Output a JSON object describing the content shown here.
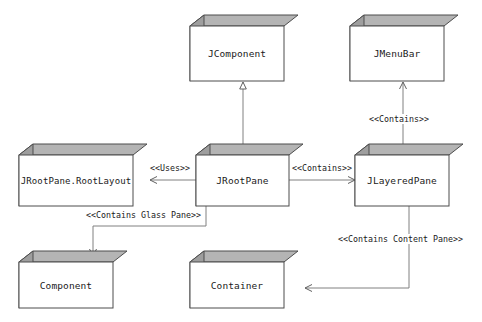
{
  "diagram": {
    "type": "uml-class-diagram",
    "background_color": "#ffffff",
    "box_face_color": "#ffffff",
    "box_shade_color": "#a0a0a0",
    "box_top_color": "#b4b4b4",
    "stroke_color": "#4d4d4d",
    "nodes": [
      {
        "id": "jcomponent",
        "label": "JComponent"
      },
      {
        "id": "jmenubar",
        "label": "JMenuBar"
      },
      {
        "id": "jrootpane_rootlayout",
        "label": "JRootPane.RootLayout"
      },
      {
        "id": "jrootpane",
        "label": "JRootPane"
      },
      {
        "id": "jlayeredpane",
        "label": "JLayeredPane"
      },
      {
        "id": "component",
        "label": "Component"
      },
      {
        "id": "container",
        "label": "Container"
      }
    ],
    "edges": [
      {
        "id": "e-inherit",
        "from": "jrootpane",
        "to": "jcomponent",
        "label": "",
        "arrow": "hollow-triangle"
      },
      {
        "id": "e-uses",
        "from": "jrootpane",
        "to": "jrootpane_rootlayout",
        "label": "<<Uses>>",
        "arrow": "open"
      },
      {
        "id": "e-contains-lp",
        "from": "jrootpane",
        "to": "jlayeredpane",
        "label": "<<Contains>>",
        "arrow": "open"
      },
      {
        "id": "e-contains-mb",
        "from": "jlayeredpane",
        "to": "jmenubar",
        "label": "<<Contains>>",
        "arrow": "open"
      },
      {
        "id": "e-glass-pane",
        "from": "jrootpane",
        "to": "component",
        "label": "<<Contains Glass Pane>>",
        "arrow": "open"
      },
      {
        "id": "e-content-pane",
        "from": "jlayeredpane",
        "to": "container",
        "label": "<<Contains Content Pane>>",
        "arrow": "open"
      }
    ]
  }
}
